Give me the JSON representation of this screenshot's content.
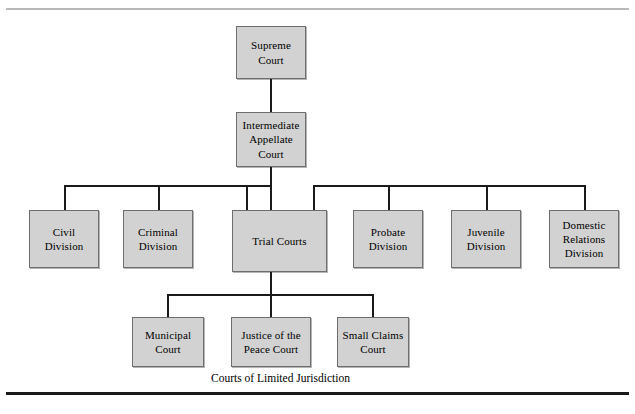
{
  "figure": {
    "caption": "Courts of Limited Jurisdiction"
  },
  "nodes": {
    "supreme_court": "Supreme Court",
    "intermediate_appellate_court": "Intermediate Appellate Court",
    "civil_division": "Civil Division",
    "criminal_division": "Criminal Division",
    "trial_courts": "Trial Courts",
    "probate_division": "Probate Division",
    "juvenile_division": "Juvenile Division",
    "domestic_relations_division": "Domestic Relations Division",
    "municipal_court": "Municipal Court",
    "justice_of_the_peace_court": "Justice of the Peace Court",
    "small_claims_court": "Small Claims Court"
  },
  "colors": {
    "node_fill": "#d2d2d2",
    "node_border": "#6e6e6e",
    "connector": "#1a1a1a",
    "rule_top": "#b9b9b9",
    "rule_bottom": "#1a1a1a",
    "text": "#000000"
  }
}
